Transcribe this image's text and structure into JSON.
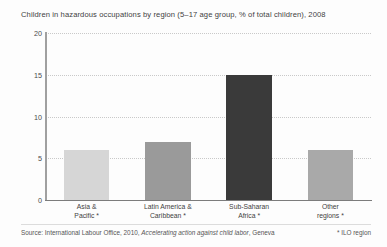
{
  "chart_data": {
    "type": "bar",
    "title": "Children in hazardous occupations by region (5–17 age group, % of total children), 2008",
    "xlabel": "",
    "ylabel": "",
    "ylim": [
      0,
      20
    ],
    "yticks": [
      "0",
      "5",
      "10",
      "15",
      "20"
    ],
    "grid": true,
    "legend": "none",
    "categories": [
      "Asia &\nPacific *",
      "Latin America &\nCaribbean *",
      "Sub-Saharan\nAfrica *",
      "Other\nregions *"
    ],
    "category_lines": [
      [
        "Asia &",
        "Pacific *"
      ],
      [
        "Latin America &",
        "Caribbean *"
      ],
      [
        "Sub-Saharan",
        "Africa *"
      ],
      [
        "Other",
        "regions *"
      ]
    ],
    "values": [
      6,
      7,
      15,
      6
    ],
    "bar_colors": [
      "#d6d6d6",
      "#9a9a9a",
      "#3a3a3a",
      "#a9a9a9"
    ]
  },
  "footer": {
    "source_prefix": "Source: International Labour Office, 2010, ",
    "source_title": "Accelerating action against child labor",
    "source_suffix": ", Geneva",
    "region_note": "* ILO region"
  },
  "axis": {
    "y_max": 20
  }
}
